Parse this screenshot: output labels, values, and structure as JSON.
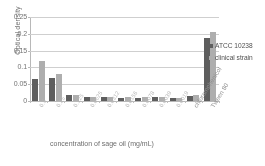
{
  "chart_data": {
    "type": "bar",
    "title": "",
    "xlabel": "concentration of sage oil (mg/mL)",
    "ylabel": "Optical density",
    "ylim": [
      0,
      0.25
    ],
    "ytick_labels": [
      "0",
      "0.05",
      "0.1",
      "0.15",
      "0.2",
      "0.25"
    ],
    "ytick_values": [
      0,
      0.05,
      0.1,
      0.15,
      0.2,
      0.25
    ],
    "grid": true,
    "legend_position": "right",
    "categories": [
      "0.5",
      "0.25",
      "0.125",
      "0.0625",
      "0.0312",
      "0.0156",
      "0.0078",
      "0.0039",
      "0.0019",
      "chloramphenicol",
      "Tween 80"
    ],
    "series": [
      {
        "name": "ATCC 10238",
        "color": "#595959",
        "values": [
          0.065,
          0.069,
          0.017,
          0.012,
          0.012,
          0.01,
          0.01,
          0.013,
          0.009,
          0.016,
          0.187
        ]
      },
      {
        "name": "clinical strain",
        "color": "#aeaeae",
        "values": [
          0.118,
          0.079,
          0.017,
          0.012,
          0.012,
          0.011,
          0.011,
          0.013,
          0.009,
          0.018,
          0.205
        ]
      }
    ]
  },
  "legend": {
    "items": [
      {
        "label": "ATCC 10238"
      },
      {
        "label": "clinical strain"
      }
    ]
  }
}
